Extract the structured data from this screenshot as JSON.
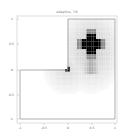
{
  "chart_data": {
    "type": "heatmap",
    "title": "Adaptive, 7/8",
    "xlabel": "",
    "ylabel": "",
    "xlim": [
      -1,
      1
    ],
    "ylim": [
      -1,
      1
    ],
    "xticks": [
      "-1",
      "-0.5",
      "0",
      "0.5",
      "1"
    ],
    "yticks": [
      "1",
      "0.5",
      "0",
      "-0.5",
      "-1"
    ],
    "grid": false,
    "colormap": "gray_r",
    "domain": "L-shaped (top-left quadrant removed)",
    "features": [
      {
        "name": "cross-blob",
        "center": [
          0.5,
          0.5
        ],
        "intensity": 1.0
      },
      {
        "name": "corner-singularity",
        "center": [
          0.0,
          0.0
        ],
        "intensity": 0.9
      },
      {
        "name": "halo-medium",
        "center": [
          0.5,
          0.5
        ],
        "intensity": 0.45
      },
      {
        "name": "tail-below",
        "center": [
          0.5,
          0.1
        ],
        "intensity": 0.35
      }
    ]
  },
  "colors": {
    "background": "#ffffff",
    "axes": "#bbbbbb",
    "domain_edge": "#999999",
    "dark": "#000000",
    "mid": "#8c8c8c",
    "light": "#d8d8d8",
    "faint": "#efefef"
  }
}
